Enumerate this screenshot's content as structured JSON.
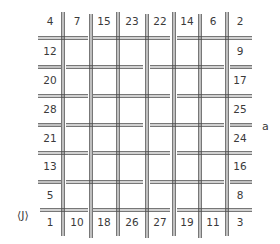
{
  "diagram": {
    "type": "woven-grid-magic-square",
    "colors": {
      "ink": "#4a4a4a",
      "text": "#3a3a3a",
      "background": "#ffffff"
    },
    "grid": {
      "col_centers": [
        50,
        77,
        104,
        132,
        160,
        187,
        213,
        240
      ],
      "row_centers": [
        22,
        52,
        81,
        110,
        139,
        167,
        196,
        223
      ],
      "v_lines_x": [
        63,
        91,
        118,
        147,
        174,
        200,
        227
      ],
      "h_lines_y": [
        38,
        67,
        96,
        125,
        153,
        182,
        210
      ],
      "double_gap": 2.4
    },
    "top_row": [
      "4",
      "7",
      "15",
      "23",
      "22",
      "14",
      "6",
      "2"
    ],
    "left_column": [
      "4",
      "12",
      "20",
      "28",
      "21",
      "13",
      "5",
      "1"
    ],
    "right_column": [
      "2",
      "9",
      "17",
      "25",
      "24",
      "16",
      "8",
      "3"
    ],
    "bottom_row": [
      "1",
      "10",
      "18",
      "26",
      "27",
      "19",
      "11",
      "3"
    ],
    "border_numbers": [
      {
        "text": "4",
        "col": 0,
        "row": 0
      },
      {
        "text": "7",
        "col": 1,
        "row": 0
      },
      {
        "text": "15",
        "col": 2,
        "row": 0
      },
      {
        "text": "23",
        "col": 3,
        "row": 0
      },
      {
        "text": "22",
        "col": 4,
        "row": 0
      },
      {
        "text": "14",
        "col": 5,
        "row": 0
      },
      {
        "text": "6",
        "col": 6,
        "row": 0
      },
      {
        "text": "2",
        "col": 7,
        "row": 0
      },
      {
        "text": "12",
        "col": 0,
        "row": 1
      },
      {
        "text": "9",
        "col": 7,
        "row": 1
      },
      {
        "text": "20",
        "col": 0,
        "row": 2
      },
      {
        "text": "17",
        "col": 7,
        "row": 2
      },
      {
        "text": "28",
        "col": 0,
        "row": 3
      },
      {
        "text": "25",
        "col": 7,
        "row": 3
      },
      {
        "text": "21",
        "col": 0,
        "row": 4
      },
      {
        "text": "24",
        "col": 7,
        "row": 4
      },
      {
        "text": "13",
        "col": 0,
        "row": 5
      },
      {
        "text": "16",
        "col": 7,
        "row": 5
      },
      {
        "text": "5",
        "col": 0,
        "row": 6
      },
      {
        "text": "8",
        "col": 7,
        "row": 6
      },
      {
        "text": "1",
        "col": 0,
        "row": 7
      },
      {
        "text": "10",
        "col": 1,
        "row": 7
      },
      {
        "text": "18",
        "col": 2,
        "row": 7
      },
      {
        "text": "26",
        "col": 3,
        "row": 7
      },
      {
        "text": "27",
        "col": 4,
        "row": 7
      },
      {
        "text": "19",
        "col": 5,
        "row": 7
      },
      {
        "text": "11",
        "col": 6,
        "row": 7
      },
      {
        "text": "3",
        "col": 7,
        "row": 7
      }
    ],
    "v_segments": [
      [
        [
          12,
          70
        ],
        [
          70,
          127
        ],
        [
          127,
          185
        ],
        [
          185,
          236
        ]
      ],
      [
        [
          14,
          42
        ],
        [
          42,
          99
        ],
        [
          99,
          156
        ],
        [
          156,
          213
        ],
        [
          213,
          238
        ]
      ],
      [
        [
          12,
          70
        ],
        [
          70,
          127
        ],
        [
          127,
          185
        ],
        [
          185,
          236
        ]
      ],
      [
        [
          14,
          42
        ],
        [
          42,
          99
        ],
        [
          99,
          156
        ],
        [
          156,
          213
        ],
        [
          213,
          238
        ]
      ],
      [
        [
          12,
          70
        ],
        [
          70,
          127
        ],
        [
          127,
          185
        ],
        [
          185,
          236
        ]
      ],
      [
        [
          14,
          42
        ],
        [
          42,
          99
        ],
        [
          99,
          156
        ],
        [
          156,
          213
        ],
        [
          213,
          238
        ]
      ],
      [
        [
          12,
          70
        ],
        [
          70,
          127
        ],
        [
          127,
          185
        ],
        [
          185,
          236
        ]
      ]
    ],
    "h_segments": [
      [
        [
          38,
          88
        ],
        [
          93,
          170
        ],
        [
          177,
          252
        ]
      ],
      [
        [
          38,
          61
        ],
        [
          66,
          143
        ],
        [
          150,
          224
        ],
        [
          230,
          252
        ]
      ],
      [
        [
          38,
          88
        ],
        [
          93,
          170
        ],
        [
          177,
          252
        ]
      ],
      [
        [
          38,
          61
        ],
        [
          66,
          143
        ],
        [
          150,
          224
        ],
        [
          230,
          252
        ]
      ],
      [
        [
          38,
          88
        ],
        [
          93,
          170
        ],
        [
          177,
          252
        ]
      ],
      [
        [
          38,
          61
        ],
        [
          66,
          143
        ],
        [
          150,
          224
        ],
        [
          230,
          252
        ]
      ],
      [
        [
          40,
          88
        ],
        [
          93,
          170
        ],
        [
          177,
          252
        ]
      ]
    ],
    "labels": {
      "side_label": "a",
      "corner_label": "⟨J⟩"
    }
  }
}
